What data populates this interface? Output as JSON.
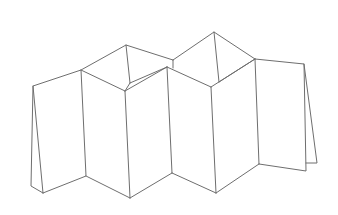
{
  "figure": {
    "background": "#ffffff",
    "stroke_color": "#6e6e6e",
    "panel_count": 6,
    "vertices": {
      "left_flap_top": [
        33,
        86
      ],
      "left_flap_back_bottom": [
        31,
        186
      ],
      "left_panel_bottom": [
        43,
        193
      ],
      "A_top": [
        81,
        70
      ],
      "A_bottom": [
        86,
        176
      ],
      "B_top": [
        125,
        91
      ],
      "B_bottom": [
        130,
        198
      ],
      "peak1_top": [
        126,
        45
      ],
      "peak1_inner": [
        130,
        83
      ],
      "C_top": [
        167,
        67
      ],
      "C_bottom": [
        172,
        173
      ],
      "notch_top": [
        173,
        60
      ],
      "D_top": [
        211,
        87
      ],
      "D_bottom": [
        216,
        193
      ],
      "peak2_top": [
        214,
        32
      ],
      "peak2_inner": [
        219,
        82
      ],
      "E_top": [
        255,
        59
      ],
      "E_bottom": [
        259,
        164
      ],
      "right_panel_top": [
        304,
        64
      ],
      "right_panel_bottom": [
        306,
        171
      ],
      "right_flap_bottom": [
        317,
        163
      ]
    }
  }
}
